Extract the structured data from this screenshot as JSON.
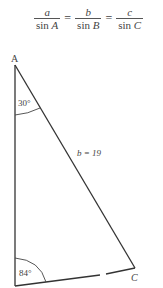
{
  "formula": {
    "terms": [
      {
        "numerator": "a",
        "denominator_fn": "sin",
        "denominator_var": "A"
      },
      {
        "numerator": "b",
        "denominator_fn": "sin",
        "denominator_var": "B"
      },
      {
        "numerator": "c",
        "denominator_fn": "sin",
        "denominator_var": "C"
      }
    ],
    "equals": "="
  },
  "triangle": {
    "vertices": {
      "A": {
        "label": "A",
        "x": 15,
        "y": 65
      },
      "B": {
        "label": "",
        "x": 15,
        "y": 286
      },
      "C": {
        "label": "C",
        "x": 135,
        "y": 268
      }
    },
    "angles": {
      "A": "30°",
      "B": "84°"
    },
    "sides": {
      "b": "b = 19"
    },
    "colors": {
      "stroke": "#333333",
      "text": "#444444"
    }
  }
}
